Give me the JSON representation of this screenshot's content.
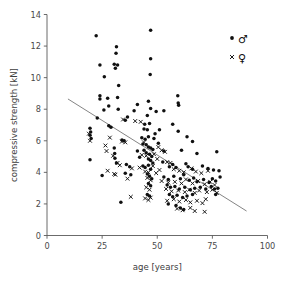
{
  "chart_data": {
    "type": "scatter",
    "title": "",
    "xlabel": "age [years]",
    "ylabel": "compressive strength [kN]",
    "xlim": [
      0,
      100
    ],
    "ylim": [
      0,
      14
    ],
    "xticks": [
      0,
      25,
      50,
      75,
      100
    ],
    "yticks": [
      0,
      2,
      4,
      6,
      8,
      10,
      12,
      14
    ],
    "xtick_labels": [
      "0",
      "25",
      "50",
      "75",
      "100"
    ],
    "ytick_labels": [
      "0",
      "2",
      "4",
      "6",
      "8",
      "10",
      "12",
      "14"
    ],
    "grid": false,
    "legend_position": "top-right",
    "legend": [
      {
        "key": "male",
        "symbol": "♂",
        "marker": "filled-circle",
        "color": "#101010"
      },
      {
        "key": "female",
        "symbol": "♀",
        "marker": "cross",
        "color": "#101010"
      }
    ],
    "trend_line": {
      "label": "linear regression",
      "x": [
        9.5,
        90.5
      ],
      "y": [
        8.65,
        1.55
      ],
      "color": "#6e6e6e"
    },
    "series": [
      {
        "name": "male",
        "marker": "filled-circle",
        "color": "#101010",
        "points": [
          [
            22.3,
            12.65
          ],
          [
            47.0,
            13.0
          ],
          [
            31.5,
            11.95
          ],
          [
            31.3,
            11.55
          ],
          [
            47.0,
            11.2
          ],
          [
            24.0,
            10.8
          ],
          [
            30.5,
            10.85
          ],
          [
            32.0,
            10.8
          ],
          [
            31.0,
            10.6
          ],
          [
            26.0,
            10.05
          ],
          [
            32.5,
            9.5
          ],
          [
            46.8,
            10.2
          ],
          [
            24.0,
            8.85
          ],
          [
            24.0,
            8.65
          ],
          [
            27.5,
            8.7
          ],
          [
            32.0,
            8.75
          ],
          [
            59.3,
            8.85
          ],
          [
            59.5,
            8.4
          ],
          [
            59.7,
            8.25
          ],
          [
            46.0,
            8.5
          ],
          [
            47.0,
            8.05
          ],
          [
            41.0,
            8.3
          ],
          [
            28.0,
            8.2
          ],
          [
            32.3,
            8.0
          ],
          [
            25.8,
            7.95
          ],
          [
            39.5,
            7.9
          ],
          [
            49.5,
            7.85
          ],
          [
            53.0,
            7.9
          ],
          [
            22.8,
            7.45
          ],
          [
            36.5,
            7.5
          ],
          [
            35.5,
            7.3
          ],
          [
            45.5,
            7.6
          ],
          [
            44.3,
            7.05
          ],
          [
            46.5,
            7.1
          ],
          [
            57.0,
            7.05
          ],
          [
            28.0,
            6.95
          ],
          [
            29.0,
            6.85
          ],
          [
            44.0,
            6.75
          ],
          [
            45.5,
            6.7
          ],
          [
            51.0,
            6.7
          ],
          [
            59.5,
            6.6
          ],
          [
            19.5,
            6.8
          ],
          [
            19.8,
            6.55
          ],
          [
            19.5,
            6.35
          ],
          [
            20.0,
            6.15
          ],
          [
            34.0,
            6.05
          ],
          [
            35.0,
            6.0
          ],
          [
            43.0,
            6.2
          ],
          [
            44.5,
            6.1
          ],
          [
            46.0,
            6.25
          ],
          [
            48.5,
            6.15
          ],
          [
            63.5,
            6.25
          ],
          [
            66.0,
            5.95
          ],
          [
            43.5,
            5.8
          ],
          [
            45.0,
            5.75
          ],
          [
            46.0,
            5.6
          ],
          [
            47.0,
            5.55
          ],
          [
            48.0,
            5.45
          ],
          [
            44.0,
            5.4
          ],
          [
            45.0,
            5.25
          ],
          [
            46.5,
            5.15
          ],
          [
            47.5,
            5.0
          ],
          [
            53.0,
            5.35
          ],
          [
            61.0,
            5.4
          ],
          [
            68.0,
            5.2
          ],
          [
            77.0,
            5.3
          ],
          [
            30.5,
            5.55
          ],
          [
            30.7,
            5.2
          ],
          [
            30.8,
            4.9
          ],
          [
            46.0,
            4.85
          ],
          [
            47.0,
            4.75
          ],
          [
            48.0,
            4.6
          ],
          [
            19.5,
            4.8
          ],
          [
            31.5,
            4.6
          ],
          [
            36.0,
            4.5
          ],
          [
            37.5,
            4.35
          ],
          [
            43.5,
            4.4
          ],
          [
            44.5,
            4.3
          ],
          [
            46.0,
            4.45
          ],
          [
            47.0,
            4.2
          ],
          [
            55.5,
            4.35
          ],
          [
            57.0,
            4.5
          ],
          [
            58.5,
            4.3
          ],
          [
            63.0,
            4.55
          ],
          [
            64.0,
            4.35
          ],
          [
            66.0,
            4.2
          ],
          [
            70.5,
            4.4
          ],
          [
            73.0,
            4.25
          ],
          [
            75.5,
            4.15
          ],
          [
            78.0,
            4.1
          ],
          [
            35.5,
            3.95
          ],
          [
            38.0,
            3.85
          ],
          [
            45.5,
            3.9
          ],
          [
            46.5,
            3.75
          ],
          [
            47.5,
            3.6
          ],
          [
            53.0,
            3.7
          ],
          [
            55.0,
            3.55
          ],
          [
            57.5,
            3.75
          ],
          [
            60.5,
            3.6
          ],
          [
            62.0,
            3.85
          ],
          [
            64.5,
            3.5
          ],
          [
            66.5,
            3.65
          ],
          [
            68.0,
            3.4
          ],
          [
            71.0,
            3.55
          ],
          [
            73.5,
            3.35
          ],
          [
            75.0,
            3.6
          ],
          [
            76.5,
            3.45
          ],
          [
            78.5,
            3.7
          ],
          [
            25.0,
            3.8
          ],
          [
            46.0,
            3.3
          ],
          [
            47.0,
            3.15
          ],
          [
            54.5,
            3.2
          ],
          [
            56.0,
            3.05
          ],
          [
            58.0,
            3.1
          ],
          [
            60.0,
            2.95
          ],
          [
            62.5,
            3.05
          ],
          [
            65.0,
            2.9
          ],
          [
            67.0,
            3.0
          ],
          [
            69.5,
            3.05
          ],
          [
            72.0,
            2.95
          ],
          [
            74.5,
            3.1
          ],
          [
            76.0,
            2.95
          ],
          [
            77.5,
            3.0
          ],
          [
            45.5,
            2.6
          ],
          [
            46.5,
            2.5
          ],
          [
            55.5,
            2.6
          ],
          [
            57.0,
            2.45
          ],
          [
            59.0,
            2.55
          ],
          [
            61.5,
            2.4
          ],
          [
            63.5,
            2.5
          ],
          [
            66.0,
            2.6
          ],
          [
            76.5,
            2.6
          ],
          [
            33.5,
            2.1
          ],
          [
            55.0,
            2.0
          ],
          [
            58.5,
            1.9
          ],
          [
            60.5,
            1.75
          ],
          [
            62.0,
            1.65
          ],
          [
            52.5,
            4.65
          ],
          [
            50.5,
            5.85
          ],
          [
            49.0,
            6.45
          ],
          [
            42.0,
            4.95
          ],
          [
            41.0,
            5.35
          ]
        ]
      },
      {
        "name": "female",
        "marker": "cross",
        "color": "#101010",
        "points": [
          [
            34.5,
            7.35
          ],
          [
            40.0,
            7.25
          ],
          [
            42.5,
            7.2
          ],
          [
            19.0,
            6.45
          ],
          [
            19.5,
            6.0
          ],
          [
            28.5,
            6.2
          ],
          [
            34.0,
            5.95
          ],
          [
            35.5,
            5.9
          ],
          [
            44.0,
            5.9
          ],
          [
            50.5,
            5.6
          ],
          [
            52.0,
            5.4
          ],
          [
            53.5,
            5.3
          ],
          [
            26.5,
            5.7
          ],
          [
            27.0,
            5.35
          ],
          [
            30.0,
            5.05
          ],
          [
            43.0,
            5.1
          ],
          [
            45.0,
            5.05
          ],
          [
            48.5,
            5.15
          ],
          [
            50.0,
            4.85
          ],
          [
            54.5,
            4.65
          ],
          [
            56.0,
            4.6
          ],
          [
            32.0,
            4.6
          ],
          [
            33.0,
            4.45
          ],
          [
            38.5,
            4.25
          ],
          [
            42.0,
            4.3
          ],
          [
            44.5,
            4.05
          ],
          [
            46.0,
            4.0
          ],
          [
            51.0,
            4.15
          ],
          [
            57.5,
            4.2
          ],
          [
            60.0,
            4.1
          ],
          [
            62.0,
            4.0
          ],
          [
            65.5,
            4.25
          ],
          [
            67.5,
            4.05
          ],
          [
            70.0,
            3.95
          ],
          [
            73.0,
            4.1
          ],
          [
            27.5,
            4.1
          ],
          [
            30.5,
            3.9
          ],
          [
            36.5,
            3.6
          ],
          [
            45.5,
            3.65
          ],
          [
            47.0,
            3.5
          ],
          [
            52.0,
            3.45
          ],
          [
            55.0,
            3.35
          ],
          [
            58.0,
            3.4
          ],
          [
            61.0,
            3.3
          ],
          [
            63.0,
            3.55
          ],
          [
            66.0,
            3.3
          ],
          [
            68.5,
            3.45
          ],
          [
            71.5,
            3.25
          ],
          [
            74.0,
            3.4
          ],
          [
            76.0,
            3.2
          ],
          [
            45.0,
            3.05
          ],
          [
            46.5,
            2.9
          ],
          [
            54.0,
            2.95
          ],
          [
            56.5,
            2.8
          ],
          [
            59.5,
            2.85
          ],
          [
            62.5,
            2.75
          ],
          [
            64.5,
            2.9
          ],
          [
            67.0,
            2.7
          ],
          [
            69.0,
            2.85
          ],
          [
            72.5,
            2.75
          ],
          [
            75.0,
            2.9
          ],
          [
            77.0,
            2.7
          ],
          [
            38.0,
            2.45
          ],
          [
            44.5,
            2.35
          ],
          [
            46.0,
            2.25
          ],
          [
            47.0,
            2.4
          ],
          [
            54.5,
            2.2
          ],
          [
            57.5,
            2.3
          ],
          [
            60.0,
            2.15
          ],
          [
            63.0,
            2.25
          ],
          [
            65.0,
            2.1
          ],
          [
            68.0,
            2.2
          ],
          [
            70.5,
            2.05
          ],
          [
            72.0,
            2.3
          ],
          [
            59.0,
            1.7
          ],
          [
            61.5,
            1.6
          ],
          [
            65.0,
            1.75
          ],
          [
            71.5,
            1.5
          ],
          [
            67.0,
            1.55
          ],
          [
            49.5,
            3.95
          ],
          [
            48.0,
            4.4
          ],
          [
            31.0,
            3.85
          ]
        ]
      }
    ]
  },
  "axes": {
    "x_title": "age [years]",
    "y_title": "compressive strength [kN]"
  }
}
